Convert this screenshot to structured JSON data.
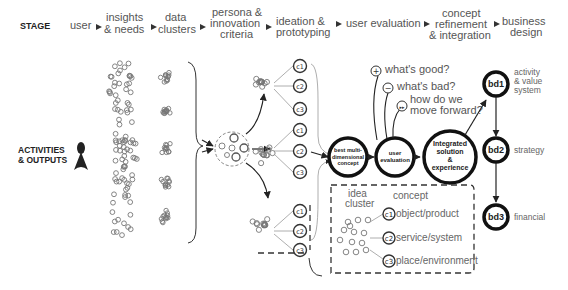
{
  "header": {
    "stage_label": "STAGE",
    "stages": [
      {
        "lines": [
          "user"
        ]
      },
      {
        "lines": [
          "insights",
          "& needs"
        ]
      },
      {
        "lines": [
          "data",
          "clusters"
        ]
      },
      {
        "lines": [
          "persona &",
          "innovation",
          "criteria"
        ]
      },
      {
        "lines": [
          "ideation &",
          "prototyping"
        ]
      },
      {
        "lines": [
          "user evaluation"
        ]
      },
      {
        "lines": [
          "concept",
          "refinement",
          "& integration"
        ]
      },
      {
        "lines": [
          "business",
          "design"
        ]
      }
    ]
  },
  "left": {
    "activities_label": [
      "ACTIVITIES",
      "& OUTPUTS"
    ],
    "person_icon": "person-icon"
  },
  "concept_nodes": [
    "c1",
    "c2",
    "c3"
  ],
  "center_nodes": {
    "best_concept": [
      "best multi-",
      "dimensional",
      "concept"
    ],
    "user_evaluation": [
      "user",
      "evaluation"
    ],
    "integrated": [
      "Integrated",
      "solution",
      "&",
      "experience"
    ]
  },
  "evaluation_questions": [
    {
      "icon": "+",
      "text": [
        "what's good?"
      ]
    },
    {
      "icon": "−",
      "text": [
        "what's bad?"
      ]
    },
    {
      "icon": "▸▸",
      "text": [
        "how do we",
        "move forward?"
      ]
    }
  ],
  "business_design": [
    {
      "id": "bd1",
      "label": [
        "activity",
        "& value",
        "system"
      ]
    },
    {
      "id": "bd2",
      "label": [
        "strategy"
      ]
    },
    {
      "id": "bd3",
      "label": [
        "financial"
      ]
    }
  ],
  "legend": {
    "idea_cluster": [
      "idea",
      "cluster"
    ],
    "concept_title": "concept",
    "items": [
      {
        "id": "c1",
        "label": "object/product"
      },
      {
        "id": "c2",
        "label": "service/system"
      },
      {
        "id": "c3",
        "label": "place/environment"
      }
    ]
  },
  "colors": {
    "ink": "#111111",
    "text": "#555555",
    "dots": "#777777"
  }
}
